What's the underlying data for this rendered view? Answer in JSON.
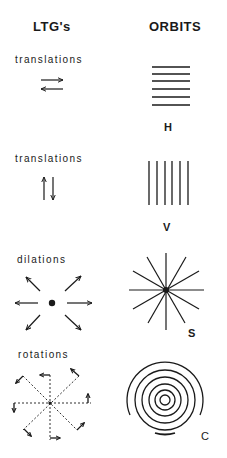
{
  "headings": {
    "left": "LTG's",
    "right": "ORBITS"
  },
  "rows": [
    {
      "ltg_label": "translations",
      "ltg_icon": "horizontal-opposing-arrows-icon",
      "orbit_icon": "horizontal-parallel-lines",
      "orbit_tag": "H"
    },
    {
      "ltg_label": "translations",
      "ltg_icon": "vertical-opposing-arrows-icon",
      "orbit_icon": "vertical-parallel-lines",
      "orbit_tag": "V"
    },
    {
      "ltg_label": "dilations",
      "ltg_icon": "radial-outward-arrows-icon",
      "orbit_icon": "star-radial-lines",
      "orbit_tag": "S"
    },
    {
      "ltg_label": "rotations",
      "ltg_icon": "dashed-rotation-field-icon",
      "orbit_icon": "concentric-circles",
      "orbit_tag": "C"
    }
  ],
  "colors": {
    "ink": "#1a1a1a",
    "background": "#ffffff"
  }
}
